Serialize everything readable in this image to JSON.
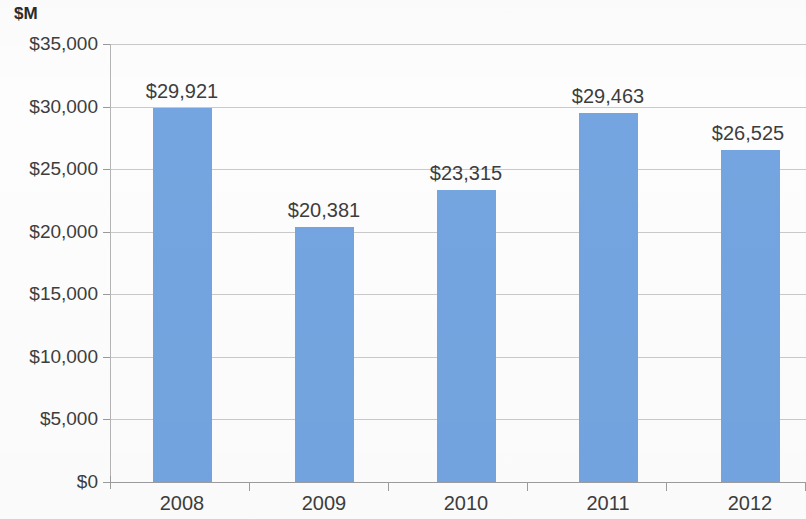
{
  "chart_data": {
    "type": "bar",
    "title": "",
    "subtitle": "",
    "axis_unit_label": "$M",
    "xlabel": "",
    "ylabel": "$M",
    "categories": [
      "2008",
      "2009",
      "2010",
      "2011",
      "2012"
    ],
    "values": [
      29921,
      20381,
      23315,
      29463,
      26525
    ],
    "data_labels": [
      "$29,921",
      "$20,381",
      "$23,315",
      "$29,463",
      "$26,525"
    ],
    "series": [
      {
        "name": "",
        "values": [
          29921,
          20381,
          23315,
          29463,
          26525
        ],
        "color": "#74a5e0"
      }
    ],
    "ylim": [
      0,
      35000
    ],
    "ytick_values": [
      35000,
      30000,
      25000,
      20000,
      15000,
      10000,
      5000,
      0
    ],
    "ytick_labels": [
      "$35,000",
      "$30,000",
      "$25,000",
      "$20,000",
      "$15,000",
      "$10,000",
      "$5,000",
      "$0"
    ],
    "grid": true,
    "grid_axis": "y",
    "legend": false,
    "legend_position": "none",
    "annotations": []
  },
  "colors": {
    "bar_fill": "#74a5e0",
    "gridline": "#c9c9c9",
    "axis_line": "#9d9d9d",
    "text": "#3d3d3d",
    "background": "#fdfdfd"
  }
}
